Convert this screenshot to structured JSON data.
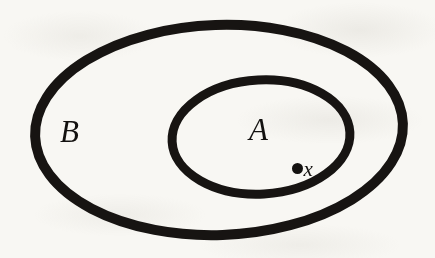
{
  "figure": {
    "kind": "euler-diagram",
    "background_color": "#f8f7f3",
    "ink_color": "#141210"
  },
  "labels": {
    "outer_set": "B",
    "inner_set": "A",
    "element": "x"
  },
  "shapes": {
    "outer_ellipse": {
      "name": "B",
      "cx": 219,
      "cy": 130,
      "rx": 184,
      "ry": 105,
      "stroke_width": 10,
      "stroke_color": "#171412",
      "fill": "none",
      "rotation_deg": -2
    },
    "inner_ellipse": {
      "name": "A",
      "cx": 261,
      "cy": 137,
      "rx": 89,
      "ry": 57,
      "stroke_width": 9,
      "stroke_color": "#171412",
      "fill": "none",
      "rotation_deg": -3
    },
    "element_dot": {
      "name": "x",
      "cx": 297,
      "cy": 163,
      "r": 5.5,
      "fill": "#141210"
    }
  }
}
